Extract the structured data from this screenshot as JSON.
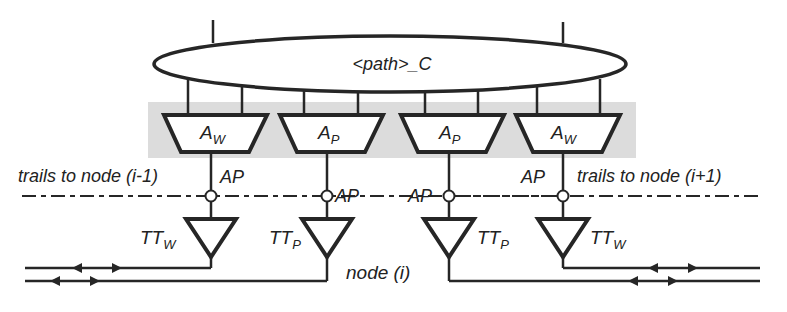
{
  "diagram": {
    "ellipse_label": "<path>_C",
    "amplifiers": [
      {
        "main": "A",
        "sub": "W"
      },
      {
        "main": "A",
        "sub": "P"
      },
      {
        "main": "A",
        "sub": "P"
      },
      {
        "main": "A",
        "sub": "W"
      }
    ],
    "access_points": [
      "AP",
      "AP",
      "AP",
      "AP"
    ],
    "trail_terminations": [
      {
        "main": "TT",
        "sub": "W"
      },
      {
        "main": "TT",
        "sub": "P"
      },
      {
        "main": "TT",
        "sub": "P"
      },
      {
        "main": "TT",
        "sub": "W"
      }
    ],
    "trails_left": "trails to node (i-1)",
    "trails_right": "trails to node (i+1)",
    "node_label": "node (i)"
  },
  "colors": {
    "line": "#262626",
    "shade": "#dcdcdc",
    "background": "#ffffff"
  }
}
